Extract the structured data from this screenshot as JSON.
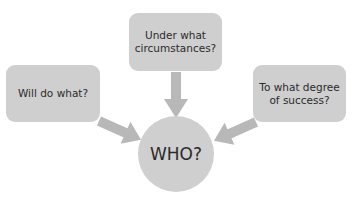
{
  "diagram": {
    "center": {
      "label": "WHO?"
    },
    "nodes": [
      {
        "id": "top",
        "label": "Under what circumstances?",
        "lines": [
          "Under what",
          "circumstances?"
        ]
      },
      {
        "id": "left",
        "label": "Will do what?",
        "lines": [
          "Will do what?"
        ]
      },
      {
        "id": "right",
        "label": "To what degree of success?",
        "lines": [
          "To what degree",
          "of success?"
        ]
      }
    ],
    "colors": {
      "shape_fill": "#cfcfcf",
      "arrow_fill": "#b8b8b8",
      "text": "#2b2b2b"
    }
  }
}
